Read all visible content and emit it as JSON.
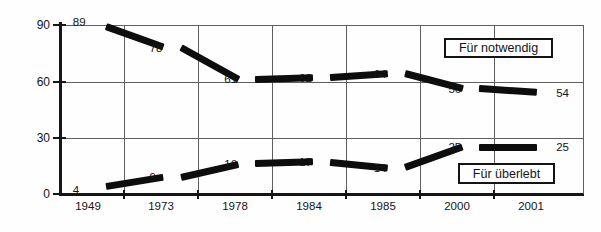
{
  "chart_data": {
    "type": "line",
    "title": "",
    "subtitle": "",
    "xlabel": "",
    "ylabel": "",
    "categories": [
      "1949",
      "1973",
      "1978",
      "1984",
      "1985",
      "2000",
      "2001"
    ],
    "series": [
      {
        "name": "Für notwendig",
        "values": [
          89,
          78,
          61,
          62,
          64,
          56,
          54
        ],
        "point_labels": [
          "89",
          "78",
          "61",
          "62",
          "64",
          "56",
          "54"
        ],
        "color": "#0d0d0d"
      },
      {
        "name": "Für überlebt",
        "values": [
          4,
          9,
          16,
          17,
          14,
          25,
          25
        ],
        "point_labels": [
          "4",
          "9",
          "16",
          "17",
          "14",
          "25",
          "25"
        ],
        "color": "#0d0d0d"
      }
    ],
    "ylim": [
      0,
      90
    ],
    "yticks": [
      0,
      30,
      60,
      90
    ],
    "ytick_labels": [
      "0",
      "30",
      "60",
      "90"
    ],
    "grid": true,
    "grid_axis": "both",
    "legend_position": "inside-right"
  },
  "legend": {
    "upper": {
      "label": "Für notwendig"
    },
    "lower": {
      "label": "Für überlebt"
    }
  },
  "axes": {
    "y_tick_labels": [
      "90",
      "60",
      "30",
      "0"
    ],
    "x_tick_labels": [
      "1949",
      "1973",
      "1978",
      "1984",
      "1985",
      "2000",
      "2001"
    ]
  }
}
